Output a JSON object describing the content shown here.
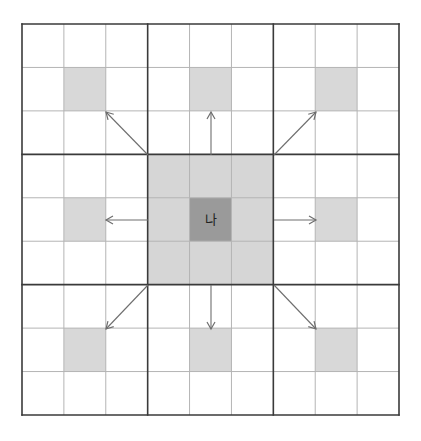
{
  "diagram": {
    "type": "grid",
    "rows": 9,
    "cols": 9,
    "block_size": 3,
    "origin": {
      "x": 22,
      "y": 24
    },
    "extent": {
      "x": 399,
      "y": 415
    },
    "center_label": "나",
    "center_cell": {
      "row": 4,
      "col": 4
    },
    "highlight_cells": [
      {
        "row": 1,
        "col": 1
      },
      {
        "row": 1,
        "col": 4
      },
      {
        "row": 1,
        "col": 7
      },
      {
        "row": 4,
        "col": 1
      },
      {
        "row": 4,
        "col": 7
      },
      {
        "row": 7,
        "col": 1
      },
      {
        "row": 7,
        "col": 4
      },
      {
        "row": 7,
        "col": 7
      }
    ],
    "center_block": {
      "row_start": 3,
      "row_end": 5,
      "col_start": 3,
      "col_end": 5
    },
    "arrows": [
      {
        "direction": "up-left",
        "from": [
          148,
          155
        ],
        "to": [
          106,
          112
        ]
      },
      {
        "direction": "up",
        "from": [
          211,
          155
        ],
        "to": [
          211,
          112
        ]
      },
      {
        "direction": "up-right",
        "from": [
          274,
          155
        ],
        "to": [
          316,
          112
        ]
      },
      {
        "direction": "left",
        "from": [
          148,
          220
        ],
        "to": [
          106,
          220
        ]
      },
      {
        "direction": "right",
        "from": [
          274,
          220
        ],
        "to": [
          316,
          220
        ]
      },
      {
        "direction": "down-left",
        "from": [
          148,
          285
        ],
        "to": [
          106,
          329
        ]
      },
      {
        "direction": "down",
        "from": [
          211,
          285
        ],
        "to": [
          211,
          329
        ]
      },
      {
        "direction": "down-right",
        "from": [
          274,
          285
        ],
        "to": [
          316,
          329
        ]
      }
    ],
    "colors": {
      "background": "#ffffff",
      "thin_line": "#b4b4b4",
      "thick_line": "#3a3a3a",
      "block_fill": "#d6d6d6",
      "highlight_fill": "#d8d8d8",
      "center_fill": "#9a9a9a",
      "arrow": "#6e6e6e",
      "label": "#222222"
    }
  }
}
